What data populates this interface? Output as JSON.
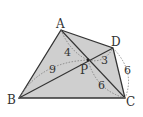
{
  "diagram": {
    "type": "geometry",
    "shape": "quadrilateral ABCD with diagonals intersecting at P",
    "fill_color": "#cfcfcf",
    "stroke_color": "#333333",
    "points": {
      "A": {
        "label": "A",
        "x": 61,
        "y": 30
      },
      "B": {
        "label": "B",
        "x": 19,
        "y": 98
      },
      "C": {
        "label": "C",
        "x": 125,
        "y": 98
      },
      "D": {
        "label": "D",
        "x": 113,
        "y": 48
      },
      "P": {
        "label": "P",
        "x": 88,
        "y": 60
      }
    },
    "segment_lengths": {
      "AP": "4",
      "BP": "9",
      "DP": "3",
      "CP": "6",
      "DC": "6"
    }
  }
}
